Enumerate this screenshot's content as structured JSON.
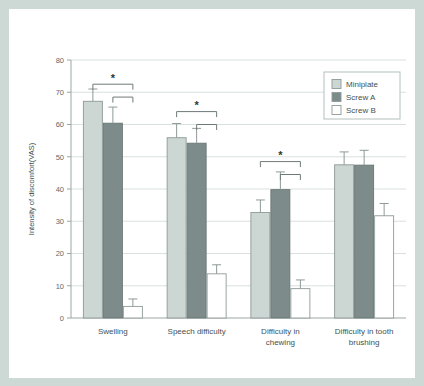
{
  "figure": {
    "frame_color": "#ccd9d5",
    "panel_color": "#ffffff"
  },
  "chart_data": {
    "type": "bar",
    "title": "",
    "subtitle": "",
    "xlabel": "",
    "ylabel": "Intensity of discomfort(VAS)",
    "ylim": [
      0,
      80
    ],
    "yticks": [
      "0",
      "10",
      "20",
      "30",
      "40",
      "50",
      "60",
      "70",
      "80"
    ],
    "ytick_values": [
      0,
      10,
      20,
      30,
      40,
      50,
      60,
      70,
      80
    ],
    "grid": "horizontal",
    "legend_position": "upper-right",
    "categories": [
      "Swelling",
      "Speech difficulty",
      "Difficulty in chewing",
      "Difficulty in tooth brushing"
    ],
    "category_label_lines": [
      [
        "Swelling"
      ],
      [
        "Speech difficulty"
      ],
      [
        "Difficulty in",
        "chewing"
      ],
      [
        "Difficulty in tooth",
        "brushing"
      ]
    ],
    "series": [
      {
        "name": "Miniplate",
        "color": "#ccd6d3",
        "edge_color": "#8e9a98",
        "values": [
          67.2,
          55.9,
          32.7,
          47.5
        ],
        "errors": [
          3.8,
          4.4,
          3.9,
          4.0
        ]
      },
      {
        "name": "Screw A",
        "color": "#7d8c8a",
        "edge_color": "#687674",
        "values": [
          60.4,
          54.2,
          39.8,
          47.4
        ],
        "errors": [
          5.0,
          4.6,
          5.5,
          4.6
        ]
      },
      {
        "name": "Screw B",
        "color": "#ffffff",
        "edge_color": "#8e9a98",
        "values": [
          3.6,
          13.7,
          9.1,
          31.7
        ],
        "errors": [
          2.3,
          2.8,
          2.7,
          3.8
        ]
      }
    ],
    "annotations": [
      {
        "label": "*",
        "group": "Swelling",
        "compare_outer": [
          "Miniplate",
          "Screw B"
        ],
        "compare_inner": [
          "Screw A",
          "Screw B"
        ]
      },
      {
        "label": "*",
        "group": "Speech difficulty",
        "compare_outer": [
          "Miniplate",
          "Screw B"
        ],
        "compare_inner": [
          "Screw A",
          "Screw B"
        ]
      },
      {
        "label": "*",
        "group": "Difficulty in chewing",
        "compare_outer": [
          "Miniplate",
          "Screw B"
        ],
        "compare_inner": [
          "Screw A",
          "Screw B"
        ]
      }
    ]
  },
  "legend": {
    "entries": [
      {
        "label": "Miniplate",
        "swatch": "#ccd6d3"
      },
      {
        "label": "Screw A",
        "swatch": "#7d8c8a"
      },
      {
        "label": "Screw B",
        "swatch": "#ffffff"
      }
    ]
  }
}
